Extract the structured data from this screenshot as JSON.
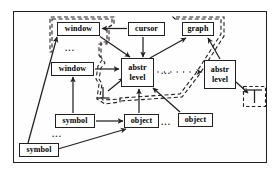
{
  "figure": {
    "kind": "node-link-diagram",
    "title": "",
    "frame": {
      "border_color": "#231f20",
      "background": "#fefefe"
    }
  },
  "legend_colors": {
    "ink": "#231f20",
    "node_fill": "#ffffff",
    "dashed_region": "#231f20"
  },
  "nodes": [
    {
      "id": "window-top",
      "label": "window",
      "lines": [
        "window"
      ],
      "x": 57,
      "y": 22,
      "w": 43,
      "h": 14
    },
    {
      "id": "cursor",
      "label": "cursor",
      "lines": [
        "cursor"
      ],
      "x": 128,
      "y": 22,
      "w": 37,
      "h": 14
    },
    {
      "id": "graph",
      "label": "graph",
      "lines": [
        "graph"
      ],
      "x": 182,
      "y": 22,
      "w": 32,
      "h": 14
    },
    {
      "id": "window-mid",
      "label": "window",
      "lines": [
        "window"
      ],
      "x": 51,
      "y": 62,
      "w": 43,
      "h": 14
    },
    {
      "id": "abstr-level-c",
      "label": "abstr level",
      "lines": [
        "abstr",
        "level"
      ],
      "x": 121,
      "y": 58,
      "w": 33,
      "h": 29
    },
    {
      "id": "abstr-level-r",
      "label": "abstr level",
      "lines": [
        "abstr",
        "level"
      ],
      "x": 204,
      "y": 60,
      "w": 32,
      "h": 29
    },
    {
      "id": "symbol-mid",
      "label": "symbol",
      "lines": [
        "symbol"
      ],
      "x": 55,
      "y": 114,
      "w": 40,
      "h": 14
    },
    {
      "id": "object-left",
      "label": "object",
      "lines": [
        "object"
      ],
      "x": 124,
      "y": 114,
      "w": 35,
      "h": 14
    },
    {
      "id": "object-right",
      "label": "object",
      "lines": [
        "object"
      ],
      "x": 178,
      "y": 113,
      "w": 35,
      "h": 14
    },
    {
      "id": "symbol-bottom",
      "label": "symbol",
      "lines": [
        "symbol"
      ],
      "x": 19,
      "y": 143,
      "w": 40,
      "h": 14
    }
  ],
  "bottom_symbols": [
    {
      "id": "tack-center",
      "glyph": "up-tack",
      "x": 100,
      "y": 88,
      "w": 18,
      "h": 16
    },
    {
      "id": "tack-right",
      "glyph": "up-tack",
      "x": 245,
      "y": 88,
      "w": 20,
      "h": 17
    }
  ],
  "ellipses": [
    {
      "id": "ellipsis-upper-left",
      "text": "...",
      "x": 65,
      "y": 49
    },
    {
      "id": "ellipsis-center",
      "text": "...",
      "x": 160,
      "y": 70
    },
    {
      "id": "ellipsis-object",
      "text": "...",
      "x": 160,
      "y": 117
    },
    {
      "id": "ellipsis-lower-left",
      "text": "...",
      "x": 52,
      "y": 134
    }
  ],
  "edges": [
    {
      "from": "cursor",
      "to": "window-top",
      "style": "solid",
      "arrow": true
    },
    {
      "from": "cursor",
      "to": "abstr-level-c",
      "style": "solid",
      "arrow": true
    },
    {
      "from": "window-top",
      "to": "abstr-level-c",
      "style": "solid",
      "arrow": true
    },
    {
      "from": "window-mid",
      "to": "abstr-level-c",
      "style": "solid",
      "arrow": true
    },
    {
      "from": "abstr-level-c",
      "to": "graph",
      "style": "solid",
      "arrow": true
    },
    {
      "from": "abstr-level-r",
      "to": "graph",
      "style": "solid",
      "arrow": true
    },
    {
      "from": "abstr-level-c",
      "to": "abstr-level-r",
      "style": "dotted-chain",
      "arrow": true
    },
    {
      "from": "abstr-level-r",
      "to": "tack-right",
      "style": "solid",
      "arrow": true
    },
    {
      "from": "tack-center",
      "to": "abstr-level-c",
      "style": "solid",
      "arrow": true
    },
    {
      "from": "symbol-mid",
      "to": "window-mid",
      "style": "solid",
      "arrow": true
    },
    {
      "from": "symbol-mid",
      "to": "object-left",
      "style": "solid",
      "arrow": true
    },
    {
      "from": "object-left",
      "to": "abstr-level-c",
      "style": "solid",
      "arrow": true
    },
    {
      "from": "object-right",
      "to": "abstr-level-c",
      "style": "solid",
      "arrow": true
    },
    {
      "from": "symbol-bottom",
      "to": "object-left",
      "style": "solid",
      "arrow": true
    },
    {
      "from": "symbol-bottom",
      "to": "window-top",
      "style": "solid",
      "arrow": true
    }
  ],
  "dashed_regions": [
    {
      "id": "region-window-group",
      "encloses": [
        "window-top",
        "window-mid",
        "tack-center"
      ]
    },
    {
      "id": "region-graph-group",
      "encloses": [
        "graph",
        "abstr-level-c"
      ]
    },
    {
      "id": "region-tack-right",
      "encloses": [
        "tack-right"
      ]
    }
  ]
}
